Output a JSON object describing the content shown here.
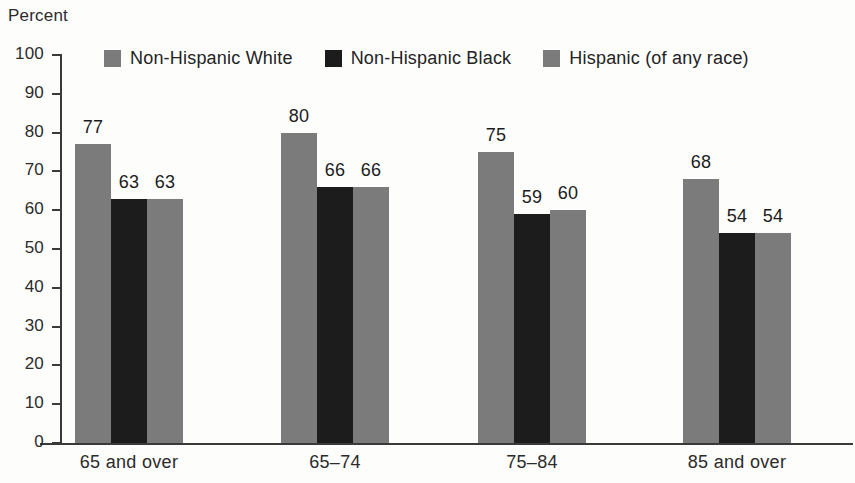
{
  "chart_data": {
    "type": "bar",
    "title": "",
    "subtitle": "",
    "xlabel": "",
    "ylabel": "Percent",
    "ylim": [
      0,
      100
    ],
    "ytick_values": [
      100,
      90,
      80,
      70,
      60,
      50,
      40,
      30,
      20,
      10,
      0
    ],
    "ytick_labels": [
      "100",
      "90",
      "80",
      "70",
      "60",
      "50",
      "40",
      "30",
      "20",
      "10",
      "0"
    ],
    "grid": false,
    "legend_position": "top",
    "categories": [
      "65 and over",
      "65–74",
      "75–84",
      "85 and over"
    ],
    "series": [
      {
        "name": "Non-Hispanic White",
        "color": "#7b7b7b",
        "values": [
          77,
          80,
          75,
          68
        ],
        "labels": [
          "77",
          "80",
          "75",
          "68"
        ]
      },
      {
        "name": "Non-Hispanic Black",
        "color": "#1c1c1c",
        "values": [
          63,
          66,
          59,
          54
        ],
        "labels": [
          "63",
          "66",
          "59",
          "54"
        ]
      },
      {
        "name": "Hispanic (of any race)",
        "color": "#7b7b7b",
        "values": [
          63,
          66,
          60,
          54
        ],
        "labels": [
          "63",
          "66",
          "60",
          "54"
        ]
      }
    ]
  },
  "axis": {
    "y_title": "Percent"
  },
  "legend": {
    "items": [
      {
        "label": "Non-Hispanic White",
        "color": "#7b7b7b"
      },
      {
        "label": "Non-Hispanic Black",
        "color": "#1c1c1c"
      },
      {
        "label": "Hispanic (of any race)",
        "color": "#7b7b7b"
      }
    ]
  },
  "colors": {
    "gray_bar": "#7b7b7b",
    "black_bar": "#1c1c1c",
    "axis": "#3a3a3a",
    "text": "#2b2b2b",
    "background": "#fdfdfc"
  }
}
